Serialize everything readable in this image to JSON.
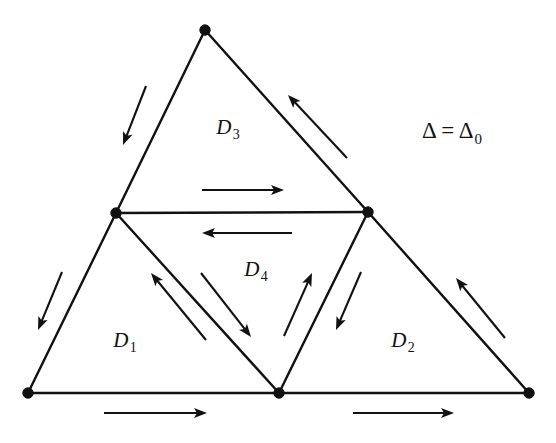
{
  "figure": {
    "background_color": "#ffffff",
    "ink_color": "#111111",
    "width": 556,
    "height": 443
  },
  "labels": {
    "d1": {
      "base": "D",
      "sub": "1",
      "x": 125,
      "y": 343
    },
    "d2": {
      "base": "D",
      "sub": "2",
      "x": 403,
      "y": 343
    },
    "d3": {
      "base": "D",
      "sub": "3",
      "x": 228,
      "y": 130
    },
    "d4": {
      "base": "D",
      "sub": "4",
      "x": 256,
      "y": 272
    },
    "delta": {
      "lhs": "Δ = Δ",
      "sub": "0",
      "x": 452,
      "y": 133
    }
  },
  "vertices": [
    {
      "name": "apex",
      "x": 205,
      "y": 30
    },
    {
      "name": "bottom-left",
      "x": 28,
      "y": 393
    },
    {
      "name": "bottom-right",
      "x": 529,
      "y": 393
    },
    {
      "name": "mid-left",
      "x": 116,
      "y": 213
    },
    {
      "name": "mid-right",
      "x": 368,
      "y": 212
    },
    {
      "name": "mid-bottom",
      "x": 279,
      "y": 393
    }
  ],
  "edges": [
    {
      "name": "apex-to-mid-left",
      "x1": 205,
      "y1": 30,
      "x2": 116,
      "y2": 213
    },
    {
      "name": "mid-left-to-bottom-left",
      "x1": 116,
      "y1": 213,
      "x2": 28,
      "y2": 393
    },
    {
      "name": "apex-to-mid-right",
      "x1": 205,
      "y1": 30,
      "x2": 368,
      "y2": 212
    },
    {
      "name": "mid-right-to-bottom-right",
      "x1": 368,
      "y1": 212,
      "x2": 529,
      "y2": 393
    },
    {
      "name": "bottom-left-to-mid-bottom",
      "x1": 28,
      "y1": 393,
      "x2": 279,
      "y2": 393
    },
    {
      "name": "mid-bottom-to-bottom-right",
      "x1": 279,
      "y1": 393,
      "x2": 529,
      "y2": 393
    },
    {
      "name": "mid-left-to-mid-right",
      "x1": 116,
      "y1": 213,
      "x2": 368,
      "y2": 212
    },
    {
      "name": "mid-left-to-mid-bottom",
      "x1": 116,
      "y1": 213,
      "x2": 279,
      "y2": 393
    },
    {
      "name": "mid-right-to-mid-bottom",
      "x1": 368,
      "y1": 212,
      "x2": 279,
      "y2": 393
    }
  ],
  "arrows": [
    {
      "name": "arrow-upper-left-edge",
      "x1": 146,
      "y1": 86,
      "x2": 123,
      "y2": 145,
      "direction": "down-left"
    },
    {
      "name": "arrow-lower-left-edge",
      "x1": 62,
      "y1": 272,
      "x2": 38,
      "y2": 330,
      "direction": "down-left"
    },
    {
      "name": "arrow-upper-right-edge",
      "x1": 347,
      "y1": 158,
      "x2": 288,
      "y2": 95,
      "direction": "up-left"
    },
    {
      "name": "arrow-lower-right-edge",
      "x1": 505,
      "y1": 338,
      "x2": 456,
      "y2": 278,
      "direction": "up-left"
    },
    {
      "name": "arrow-bottom-left-edge",
      "x1": 104,
      "y1": 413,
      "x2": 207,
      "y2": 413,
      "direction": "right"
    },
    {
      "name": "arrow-bottom-right-edge",
      "x1": 353,
      "y1": 413,
      "x2": 454,
      "y2": 413,
      "direction": "right"
    },
    {
      "name": "arrow-middle-upper",
      "x1": 202,
      "y1": 190,
      "x2": 284,
      "y2": 190,
      "direction": "right"
    },
    {
      "name": "arrow-middle-lower",
      "x1": 292,
      "y1": 233,
      "x2": 202,
      "y2": 233,
      "direction": "left"
    },
    {
      "name": "arrow-d1-inner-diagonal",
      "x1": 206,
      "y1": 340,
      "x2": 151,
      "y2": 273,
      "direction": "up-left"
    },
    {
      "name": "arrow-d4-left-diagonal",
      "x1": 201,
      "y1": 273,
      "x2": 251,
      "y2": 337,
      "direction": "down-right"
    },
    {
      "name": "arrow-d4-right-diagonal",
      "x1": 284,
      "y1": 336,
      "x2": 312,
      "y2": 273,
      "direction": "up-right"
    },
    {
      "name": "arrow-d2-inner-diagonal",
      "x1": 361,
      "y1": 272,
      "x2": 336,
      "y2": 330,
      "direction": "down-left"
    }
  ]
}
